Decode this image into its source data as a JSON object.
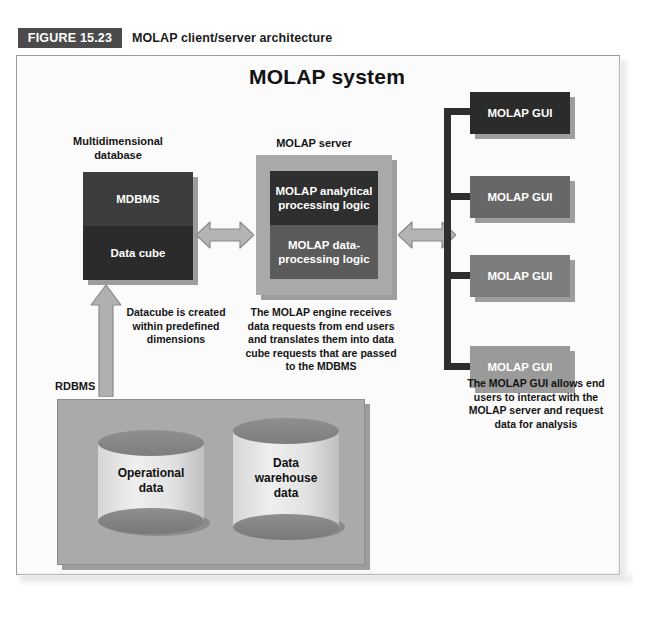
{
  "figure": {
    "badge": "FIGURE 15.23",
    "caption": "MOLAP client/server architecture"
  },
  "diagram": {
    "title": "MOLAP system",
    "left_stack": {
      "label": "Multidimensional\ndatabase",
      "label_line1": "Multidimensional",
      "label_line2": "database",
      "cells": [
        {
          "text": "MDBMS",
          "color": "#3d3d3d"
        },
        {
          "text": "Data cube",
          "color": "#2b2b2b"
        }
      ]
    },
    "server": {
      "label": "MOLAP server",
      "outer_color": "#a9a9a9",
      "cells": [
        {
          "text": "MOLAP analytical\nprocessing logic",
          "line1": "MOLAP analytical",
          "line2": "processing logic",
          "color": "#2f2f2f"
        },
        {
          "text": "MOLAP data-\nprocessing logic",
          "line1": "MOLAP data-",
          "line2": "processing logic",
          "color": "#5b5b5b"
        }
      ]
    },
    "guis": [
      {
        "text": "MOLAP GUI",
        "color": "#2b2b2b"
      },
      {
        "text": "MOLAP GUI",
        "color": "#676767"
      },
      {
        "text": "MOLAP GUI",
        "color": "#7d7d7d"
      },
      {
        "text": "MOLAP GUI",
        "color": "#9a9a9a"
      }
    ],
    "rdbms": {
      "label": "RDBMS",
      "panel_color": "#aaaaaa",
      "cylinders": [
        {
          "line1": "Operational",
          "line2": "data",
          "line3": ""
        },
        {
          "line1": "Data",
          "line2": "warehouse",
          "line3": "data"
        }
      ]
    },
    "captions": {
      "datacube": "Datacube is created within predefined dimensions",
      "datacube_lines": [
        "Datacube is created",
        "within predefined",
        "dimensions"
      ],
      "engine": "The MOLAP engine receives data requests from end users and translates them into data cube requests that are passed to the MDBMS",
      "engine_lines": [
        "The MOLAP engine receives",
        "data requests from end users",
        "and translates them into data",
        "cube requests that are passed",
        "to the MDBMS"
      ],
      "gui": "The MOLAP GUI allows end users to interact with the MOLAP server and request data for analysis",
      "gui_lines": [
        "The MOLAP GUI allows end",
        "users to interact with the",
        "MOLAP server and request",
        "data for analysis"
      ]
    },
    "connectors": {
      "db_to_server": "double-headed-arrow",
      "server_to_gui": "double-headed-arrow",
      "rdbms_to_datacube": "up-arrow",
      "gui_bracket": "bracket"
    }
  },
  "colors": {
    "badge_bg": "#4b4b4b",
    "arrow_fill": "#b4b4b4",
    "arrow_stroke": "#8a8a8a",
    "bracket": "#2e2e2e",
    "frame_border": "#9a9a9a"
  }
}
